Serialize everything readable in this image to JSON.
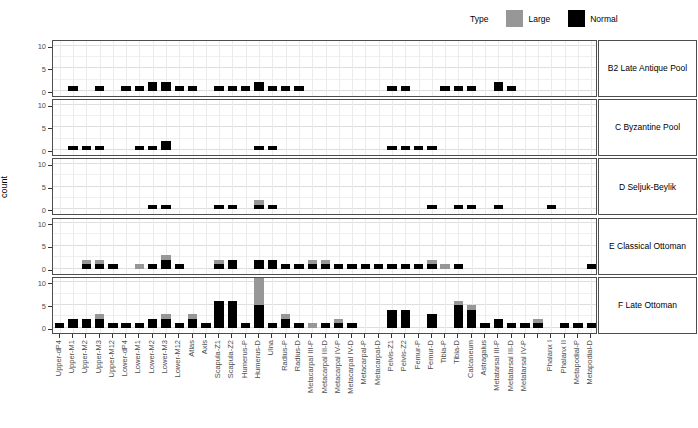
{
  "chart_data": {
    "type": "bar",
    "stacked": true,
    "ylabel": "count",
    "ylim": [
      0,
      10
    ],
    "yticks": [
      0,
      5,
      10
    ],
    "grid": true,
    "legend": {
      "title": "Type",
      "position": "top-right",
      "entries": [
        {
          "label": "Large",
          "color": "#979797"
        },
        {
          "label": "Normal",
          "color": "#000000"
        }
      ]
    },
    "categories": [
      "Upper-dP4",
      "Upper-M1",
      "Upper-M2",
      "Upper-M3",
      "Upper-M12",
      "Lower-dP4",
      "Lower-M1",
      "Lower-M2",
      "Lower-M3",
      "Lower-M12",
      "Atlas",
      "Axis",
      "Scapula-Z1",
      "Scapula-Z2",
      "Humerus-P",
      "Humerus-D",
      "Ulna",
      "Radius-P",
      "Radius-D",
      "Metacarpal III-P",
      "Metacarpal III-D",
      "Metacarpal IV-P",
      "Metacarpal IV-D",
      "Metacarpal-P",
      "Metacarpal-D",
      "Pelvis-Z1",
      "Pelvis-Z2",
      "Femur-P",
      "Femur-D",
      "Tibia-P",
      "Tibia-D",
      "Calcaneum",
      "Astragalus",
      "Metatarsal III-P",
      "Metatarsal III-D",
      "Metatarsal IV-P",
      "",
      "Phalanx I",
      "Phalanx II",
      "Metapodial-P",
      "Metapodial-D"
    ],
    "panels": [
      {
        "label": "B2 Late Antique Pool",
        "series": {
          "Normal": [
            0,
            1,
            0,
            1,
            0,
            1,
            1,
            2,
            2,
            1,
            1,
            0,
            1,
            1,
            1,
            2,
            1,
            1,
            1,
            0,
            0,
            0,
            0,
            0,
            0,
            1,
            1,
            0,
            0,
            1,
            1,
            1,
            0,
            2,
            1,
            0,
            0,
            0,
            0,
            0,
            0
          ],
          "Large": [
            0,
            0,
            0,
            0,
            0,
            0,
            0,
            0,
            0,
            0,
            0,
            0,
            0,
            0,
            0,
            0,
            0,
            0,
            0,
            0,
            0,
            0,
            0,
            0,
            0,
            0,
            0,
            0,
            0,
            0,
            0,
            0,
            0,
            0,
            0,
            0,
            0,
            0,
            0,
            0,
            0
          ]
        }
      },
      {
        "label": "C Byzantine Pool",
        "series": {
          "Normal": [
            0,
            1,
            1,
            1,
            0,
            0,
            1,
            1,
            2,
            0,
            0,
            0,
            0,
            0,
            0,
            1,
            1,
            0,
            0,
            0,
            0,
            0,
            0,
            0,
            0,
            1,
            1,
            1,
            1,
            0,
            0,
            0,
            0,
            0,
            0,
            0,
            0,
            0,
            0,
            0,
            0
          ],
          "Large": [
            0,
            0,
            0,
            0,
            0,
            0,
            0,
            0,
            0,
            0,
            0,
            0,
            0,
            0,
            0,
            0,
            0,
            0,
            0,
            0,
            0,
            0,
            0,
            0,
            0,
            0,
            0,
            0,
            0,
            0,
            0,
            0,
            0,
            0,
            0,
            0,
            0,
            0,
            0,
            0,
            0
          ]
        }
      },
      {
        "label": "D Seljuk-Beylik",
        "series": {
          "Normal": [
            0,
            0,
            0,
            0,
            0,
            0,
            0,
            1,
            1,
            0,
            0,
            0,
            1,
            1,
            0,
            1,
            1,
            0,
            0,
            0,
            0,
            0,
            0,
            0,
            0,
            0,
            0,
            0,
            1,
            0,
            1,
            1,
            0,
            1,
            0,
            0,
            0,
            1,
            0,
            0,
            0
          ],
          "Large": [
            0,
            0,
            0,
            0,
            0,
            0,
            0,
            0,
            0,
            0,
            0,
            0,
            0,
            0,
            0,
            1,
            0,
            0,
            0,
            0,
            0,
            0,
            0,
            0,
            0,
            0,
            0,
            0,
            0,
            0,
            0,
            0,
            0,
            0,
            0,
            0,
            0,
            0,
            0,
            0,
            0
          ]
        }
      },
      {
        "label": "E Classical Ottoman",
        "series": {
          "Normal": [
            0,
            0,
            1,
            1,
            1,
            0,
            0,
            1,
            2,
            1,
            0,
            0,
            1,
            2,
            0,
            2,
            2,
            1,
            1,
            1,
            1,
            1,
            1,
            1,
            1,
            1,
            1,
            1,
            1,
            0,
            1,
            0,
            0,
            0,
            0,
            0,
            0,
            0,
            0,
            0,
            1
          ],
          "Large": [
            0,
            0,
            1,
            1,
            0,
            0,
            1,
            0,
            1,
            0,
            0,
            0,
            1,
            0,
            0,
            0,
            0,
            0,
            0,
            1,
            1,
            0,
            0,
            0,
            0,
            0,
            0,
            0,
            1,
            1,
            0,
            0,
            0,
            0,
            0,
            0,
            0,
            0,
            0,
            0,
            0
          ]
        }
      },
      {
        "label": "F Late Ottoman",
        "series": {
          "Normal": [
            1,
            2,
            2,
            2,
            1,
            1,
            1,
            2,
            2,
            1,
            2,
            1,
            6,
            6,
            1,
            5,
            1,
            2,
            1,
            0,
            1,
            1,
            1,
            0,
            0,
            4,
            4,
            0,
            3,
            0,
            5,
            4,
            1,
            2,
            1,
            1,
            1,
            0,
            1,
            1,
            1
          ],
          "Large": [
            0,
            0,
            0,
            1,
            0,
            0,
            0,
            0,
            1,
            0,
            1,
            0,
            0,
            0,
            0,
            6,
            0,
            1,
            0,
            1,
            0,
            1,
            0,
            0,
            0,
            0,
            0,
            0,
            0,
            0,
            1,
            1,
            0,
            0,
            0,
            0,
            1,
            0,
            0,
            0,
            0
          ]
        }
      }
    ]
  }
}
